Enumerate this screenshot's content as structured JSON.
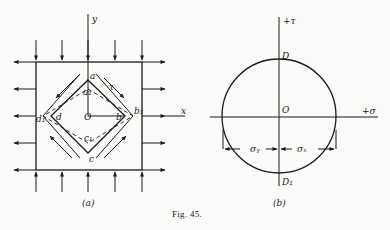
{
  "figure": {
    "caption": "Fig. 45.",
    "panel_a": {
      "label": "(a)",
      "axis_x": "x",
      "axis_y": "y",
      "points": {
        "a": "a",
        "a1": "a₁",
        "b": "b",
        "b1": "b₁",
        "c": "c",
        "c1": "c₁",
        "d": "d",
        "d1": "d₁",
        "o": "O"
      },
      "shear_label": "τ"
    },
    "panel_b": {
      "label": "(b)",
      "axis_tau": "+τ",
      "axis_sigma": "+σ",
      "points": {
        "D": "D",
        "D1": "D₁",
        "O": "O"
      },
      "dim_sigma_y": "σᵧ",
      "dim_sigma_x": "σₓ"
    }
  }
}
